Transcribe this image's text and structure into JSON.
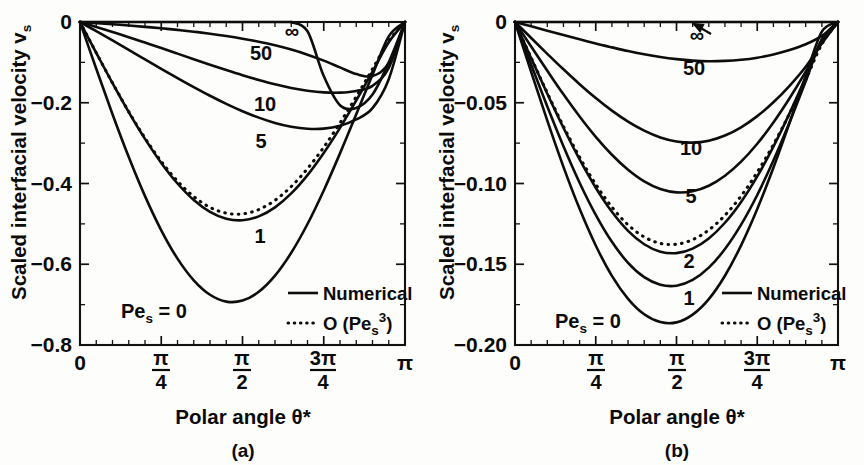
{
  "figure": {
    "background": "#fdfdfc",
    "ink_color": "#0d0d0d"
  },
  "panels": [
    {
      "id": "a",
      "caption": "(a)",
      "y_axis_title": "Scaled interfacial velocity v",
      "y_axis_title_sub": "s",
      "x_axis_title": "Polar angle θ*",
      "pe_label_main": "Pe",
      "pe_label_sub": "s",
      "pe_label_tail": " = 0",
      "y_ticks": [
        "0",
        "−0.2",
        "−0.4",
        "−0.6",
        "−0.8"
      ],
      "x_ticks": [
        "0",
        "π/4",
        "π/2",
        "3π/4",
        "π"
      ],
      "curve_labels": [
        "∞",
        "50",
        "10",
        "5",
        "1"
      ],
      "legend": [
        {
          "style": "solid",
          "label": "Numerical"
        },
        {
          "style": "dotted",
          "label_pre": "O (Pe",
          "label_sub": "s",
          "label_sup": "3",
          "label_post": ")"
        }
      ]
    },
    {
      "id": "b",
      "caption": "(b)",
      "y_axis_title": "Scaled interfacial velocity v",
      "y_axis_title_sub": "s",
      "x_axis_title": "Polar angle θ*",
      "pe_label_main": "Pe",
      "pe_label_sub": "s",
      "pe_label_tail": " = 0",
      "y_ticks": [
        "0",
        "−0.05",
        "−0.10",
        "−0.15",
        "−0.20"
      ],
      "x_ticks": [
        "0",
        "π/4",
        "π/2",
        "3π/4",
        "π"
      ],
      "curve_labels": [
        "∞",
        "50",
        "10",
        "5",
        "2",
        "1"
      ],
      "legend": [
        {
          "style": "solid",
          "label": "Numerical"
        },
        {
          "style": "dotted",
          "label_pre": "O (Pe",
          "label_sub": "s",
          "label_sup": "3",
          "label_post": ")"
        }
      ]
    }
  ],
  "chart_data": [
    {
      "type": "line",
      "panel": "a",
      "title": "(a)",
      "xlabel": "Polar angle θ*",
      "ylabel": "Scaled interfacial velocity v_s",
      "xlim": [
        0,
        3.14159265
      ],
      "ylim": [
        -0.8,
        0
      ],
      "xtick_values": [
        0,
        0.785398,
        1.570796,
        2.356194,
        3.141593
      ],
      "xtick_labels": [
        "0",
        "π/4",
        "π/2",
        "3π/4",
        "π"
      ],
      "ytick_values": [
        0,
        -0.2,
        -0.4,
        -0.6,
        -0.8
      ],
      "ytick_labels": [
        "0",
        "−0.2",
        "−0.4",
        "−0.6",
        "−0.8"
      ],
      "x_minor_per_major": 5,
      "y_minor_per_major": 2,
      "grid": false,
      "legend_position": "bottom-right",
      "legend_entries": [
        "Numerical",
        "O (Pe_s^3)"
      ],
      "annotations": [
        "Pe_s = 0",
        "1",
        "5",
        "10",
        "50",
        "∞"
      ],
      "x": [
        0,
        0.1571,
        0.3142,
        0.4712,
        0.6283,
        0.7854,
        0.9425,
        1.0996,
        1.2566,
        1.4137,
        1.5708,
        1.7279,
        1.885,
        2.042,
        2.1991,
        2.3562,
        2.5133,
        2.6704,
        2.8274,
        2.9845,
        3.1416
      ],
      "series": [
        {
          "name": "Pe_s = 0",
          "style": "solid",
          "values": [
            0,
            -0.1159,
            -0.2285,
            -0.3346,
            -0.4313,
            -0.5159,
            -0.5861,
            -0.6398,
            -0.6756,
            -0.6925,
            -0.69,
            -0.6683,
            -0.6283,
            -0.5716,
            -0.5003,
            -0.4172,
            -0.3254,
            -0.2286,
            -0.1306,
            -0.0355,
            0
          ]
        },
        {
          "name": "Pe_s = 1 (numerical)",
          "style": "solid",
          "values": [
            0,
            -0.0764,
            -0.1514,
            -0.223,
            -0.2895,
            -0.349,
            -0.4,
            -0.4409,
            -0.4703,
            -0.4872,
            -0.491,
            -0.4815,
            -0.4591,
            -0.4246,
            -0.3792,
            -0.3244,
            -0.2621,
            -0.1943,
            -0.123,
            -0.0503,
            0
          ]
        },
        {
          "name": "Pe_s = 1 (O(Pe_s^3) asymptotic)",
          "style": "dotted",
          "values": [
            0,
            -0.0762,
            -0.1509,
            -0.222,
            -0.2874,
            -0.3453,
            -0.3941,
            -0.4324,
            -0.4591,
            -0.4735,
            -0.4753,
            -0.4645,
            -0.4416,
            -0.4074,
            -0.3631,
            -0.3101,
            -0.2501,
            -0.1849,
            -0.1165,
            -0.0471,
            0
          ]
        },
        {
          "name": "Pe_s = 5",
          "style": "solid",
          "values": [
            0,
            -0.0226,
            -0.0456,
            -0.069,
            -0.0925,
            -0.1159,
            -0.1389,
            -0.1613,
            -0.1827,
            -0.2027,
            -0.2209,
            -0.2368,
            -0.2499,
            -0.2594,
            -0.2645,
            -0.2641,
            -0.257,
            -0.2414,
            -0.2134,
            -0.1416,
            0
          ]
        },
        {
          "name": "Pe_s = 10",
          "style": "solid",
          "values": [
            0,
            -0.0122,
            -0.0248,
            -0.0377,
            -0.051,
            -0.0645,
            -0.0783,
            -0.0921,
            -0.1058,
            -0.1191,
            -0.1318,
            -0.1436,
            -0.1543,
            -0.1633,
            -0.1702,
            -0.1744,
            -0.175,
            -0.1707,
            -0.1581,
            -0.1135,
            0
          ]
        },
        {
          "name": "Pe_s = 50",
          "style": "solid",
          "values": [
            0,
            -0.0027,
            -0.0056,
            -0.0087,
            -0.012,
            -0.0156,
            -0.0196,
            -0.024,
            -0.029,
            -0.0347,
            -0.0413,
            -0.0489,
            -0.0578,
            -0.0684,
            -0.0809,
            -0.0956,
            -0.1124,
            -0.129,
            -0.1341,
            -0.1015,
            0
          ]
        },
        {
          "name": "Pe_s = infinity",
          "style": "solid",
          "values": [
            0,
            0,
            0,
            0,
            0,
            0,
            0,
            0,
            0,
            0,
            0,
            0,
            0,
            0,
            -0.023,
            -0.134,
            -0.2063,
            -0.2128,
            -0.1797,
            -0.1003,
            0
          ]
        }
      ]
    },
    {
      "type": "line",
      "panel": "b",
      "title": "(b)",
      "xlabel": "Polar angle θ*",
      "ylabel": "Scaled interfacial velocity v_s",
      "xlim": [
        0,
        3.14159265
      ],
      "ylim": [
        -0.2,
        0
      ],
      "xtick_values": [
        0,
        0.785398,
        1.570796,
        2.356194,
        3.141593
      ],
      "xtick_labels": [
        "0",
        "π/4",
        "π/2",
        "3π/4",
        "π"
      ],
      "ytick_values": [
        0,
        -0.05,
        -0.1,
        -0.15,
        -0.2
      ],
      "ytick_labels": [
        "0",
        "−0.05",
        "−0.10",
        "−0.15",
        "−0.20"
      ],
      "x_minor_per_major": 5,
      "y_minor_per_major": 2,
      "grid": false,
      "legend_position": "bottom-right",
      "legend_entries": [
        "Numerical",
        "O (Pe_s^3)"
      ],
      "annotations": [
        "Pe_s = 0",
        "1",
        "2",
        "5",
        "10",
        "50",
        "∞"
      ],
      "x": [
        0,
        0.1571,
        0.3142,
        0.4712,
        0.6283,
        0.7854,
        0.9425,
        1.0996,
        1.2566,
        1.4137,
        1.5708,
        1.7279,
        1.885,
        2.042,
        2.1991,
        2.3562,
        2.5133,
        2.6704,
        2.8274,
        2.9845,
        3.1416
      ],
      "series": [
        {
          "name": "Pe_s = 0",
          "style": "solid",
          "values": [
            0,
            -0.0309,
            -0.0611,
            -0.0897,
            -0.1157,
            -0.1384,
            -0.1572,
            -0.1714,
            -0.181,
            -0.1858,
            -0.186,
            -0.1812,
            -0.1716,
            -0.1571,
            -0.1383,
            -0.1158,
            -0.0903,
            -0.0625,
            -0.0334,
            -0.006,
            0
          ]
        },
        {
          "name": "Pe_s = 1",
          "style": "solid",
          "values": [
            0,
            -0.0264,
            -0.0523,
            -0.0769,
            -0.0995,
            -0.1194,
            -0.1361,
            -0.1491,
            -0.158,
            -0.1627,
            -0.1633,
            -0.1597,
            -0.1521,
            -0.1406,
            -0.1255,
            -0.1071,
            -0.0858,
            -0.0621,
            -0.0367,
            -0.0108,
            0
          ]
        },
        {
          "name": "Pe_s = 2 (numerical)",
          "style": "solid",
          "values": [
            0,
            -0.0224,
            -0.0444,
            -0.0655,
            -0.0851,
            -0.1026,
            -0.1175,
            -0.1293,
            -0.1376,
            -0.1422,
            -0.1431,
            -0.1403,
            -0.134,
            -0.1243,
            -0.1114,
            -0.0956,
            -0.0772,
            -0.0566,
            -0.0343,
            -0.011,
            0
          ]
        },
        {
          "name": "Pe_s = 2 (O(Pe_s^3) asymptotic)",
          "style": "dotted",
          "values": [
            0,
            -0.0222,
            -0.0439,
            -0.0646,
            -0.0837,
            -0.1005,
            -0.1146,
            -0.1256,
            -0.1331,
            -0.1371,
            -0.1376,
            -0.1348,
            -0.1288,
            -0.1197,
            -0.1077,
            -0.093,
            -0.0759,
            -0.0567,
            -0.0358,
            -0.0137,
            0
          ]
        },
        {
          "name": "Pe_s = 5",
          "style": "solid",
          "values": [
            0,
            -0.0152,
            -0.0302,
            -0.0448,
            -0.0585,
            -0.0711,
            -0.0822,
            -0.0915,
            -0.0987,
            -0.1034,
            -0.1055,
            -0.1048,
            -0.1014,
            -0.0952,
            -0.0865,
            -0.0754,
            -0.0622,
            -0.0472,
            -0.0307,
            -0.0127,
            0
          ]
        },
        {
          "name": "Pe_s = 10",
          "style": "solid",
          "values": [
            0,
            -0.0099,
            -0.0197,
            -0.0293,
            -0.0385,
            -0.0471,
            -0.0549,
            -0.0617,
            -0.0673,
            -0.0715,
            -0.074,
            -0.0747,
            -0.0735,
            -0.0703,
            -0.0652,
            -0.0583,
            -0.0497,
            -0.0395,
            -0.0277,
            -0.0133,
            0
          ]
        },
        {
          "name": "Pe_s = 50",
          "style": "solid",
          "values": [
            0,
            -0.0027,
            -0.0054,
            -0.0081,
            -0.0107,
            -0.0133,
            -0.0157,
            -0.018,
            -0.02,
            -0.0217,
            -0.023,
            -0.0239,
            -0.0243,
            -0.0241,
            -0.0234,
            -0.0221,
            -0.0201,
            -0.0174,
            -0.0138,
            -0.0086,
            0
          ]
        },
        {
          "name": "Pe_s = infinity",
          "style": "solid",
          "values": [
            0,
            0,
            0,
            0,
            0,
            0,
            0,
            0,
            0,
            0,
            0,
            0,
            0,
            0,
            0,
            0,
            0,
            0,
            0,
            0,
            0
          ]
        }
      ]
    }
  ]
}
